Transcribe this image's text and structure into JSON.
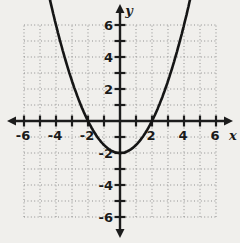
{
  "chart_data": {
    "type": "line",
    "title": "",
    "xlabel": "x",
    "ylabel": "y",
    "xlim": [
      -7.5,
      7.5
    ],
    "ylim": [
      -7.6,
      7.6
    ],
    "grid_range": [
      -6,
      6
    ],
    "grid_step": 1,
    "tick_step": 1,
    "label_step": 2,
    "grid": "dotted",
    "legend": "none",
    "x_ticks": [
      {
        "value": -6,
        "label": "-6"
      },
      {
        "value": -4,
        "label": "-4"
      },
      {
        "value": -2,
        "label": "-2"
      },
      {
        "value": 2,
        "label": "2"
      },
      {
        "value": 4,
        "label": "4"
      },
      {
        "value": 6,
        "label": "6"
      }
    ],
    "y_ticks": [
      {
        "value": 6,
        "label": "6"
      },
      {
        "value": 4,
        "label": "4"
      },
      {
        "value": 2,
        "label": "2"
      },
      {
        "value": -2,
        "label": "-2"
      },
      {
        "value": -4,
        "label": "-4"
      },
      {
        "value": -6,
        "label": "-6"
      }
    ],
    "series": [
      {
        "name": "parabola",
        "shape": "parabola",
        "coefficients": {
          "a": 0.5,
          "b": 0,
          "c": -2
        },
        "vertex": [
          0,
          -2
        ],
        "x_intercepts": [
          [
            -2,
            0
          ],
          [
            2,
            0
          ]
        ],
        "points": [
          [
            -4,
            6
          ],
          [
            -3,
            2.5
          ],
          [
            -2,
            0
          ],
          [
            -1,
            -1.5
          ],
          [
            0,
            -2
          ],
          [
            1,
            -1.5
          ],
          [
            2,
            0
          ],
          [
            3,
            2.5
          ],
          [
            4,
            6
          ]
        ],
        "draw_domain": [
          -4.42,
          4.42
        ]
      }
    ],
    "colors": {
      "background": "#f0efec",
      "grid": "#8f8f8f",
      "axis": "#1c1c1c",
      "curve": "#151515",
      "text": "#1a1a1a"
    }
  }
}
